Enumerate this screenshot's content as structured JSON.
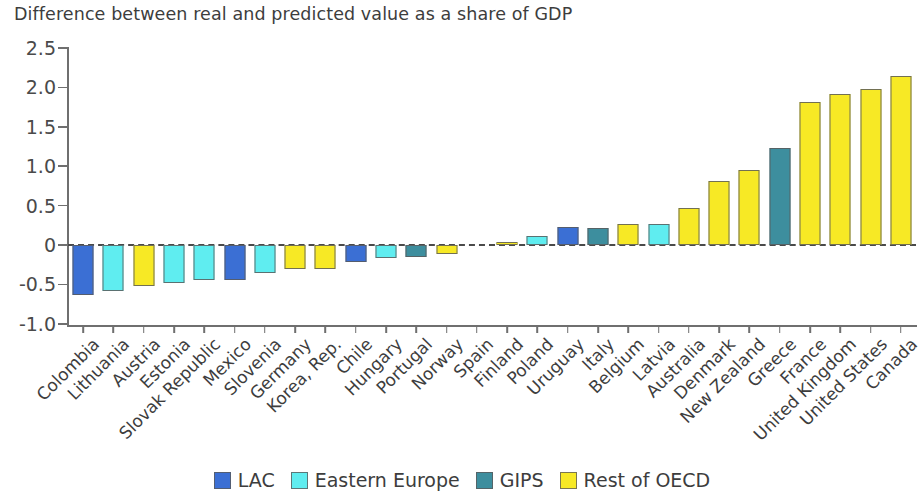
{
  "chart_data": {
    "type": "bar",
    "title": "Difference between real and predicted value as a share of GDP",
    "xlabel": "",
    "ylabel": "",
    "ylim": [
      -1.0,
      2.5
    ],
    "yticks": [
      "-1.0",
      "-0.5",
      "0",
      "0.5",
      "1.0",
      "1.5",
      "2.0",
      "2.5"
    ],
    "ytick_values": [
      -1.0,
      -0.5,
      0,
      0.5,
      1.0,
      1.5,
      2.0,
      2.5
    ],
    "grid": false,
    "zero_line": "dashed",
    "legend_position": "bottom",
    "categories": [
      "Colombia",
      "Lithuania",
      "Austria",
      "Estonia",
      "Slovak Republic",
      "Mexico",
      "Slovenia",
      "Germany",
      "Korea, Rep.",
      "Chile",
      "Hungary",
      "Portugal",
      "Norway",
      "Spain",
      "Finland",
      "Poland",
      "Uruguay",
      "Italy",
      "Belgium",
      "Latvia",
      "Australia",
      "Denmark",
      "New Zealand",
      "Greece",
      "France",
      "United Kingdom",
      "United States",
      "Canada"
    ],
    "values": [
      -0.63,
      -0.58,
      -0.52,
      -0.48,
      -0.45,
      -0.45,
      -0.35,
      -0.31,
      -0.3,
      -0.22,
      -0.17,
      -0.15,
      -0.11,
      0.0,
      0.04,
      0.11,
      0.23,
      0.22,
      0.27,
      0.27,
      0.47,
      0.81,
      0.95,
      1.23,
      1.81,
      1.91,
      1.98,
      2.14
    ],
    "groups": [
      "LAC",
      "Eastern Europe",
      "Rest of OECD",
      "Eastern Europe",
      "Eastern Europe",
      "LAC",
      "Eastern Europe",
      "Rest of OECD",
      "Rest of OECD",
      "LAC",
      "Eastern Europe",
      "GIPS",
      "Rest of OECD",
      "GIPS",
      "Rest of OECD",
      "Eastern Europe",
      "LAC",
      "GIPS",
      "Rest of OECD",
      "Eastern Europe",
      "Rest of OECD",
      "Rest of OECD",
      "Rest of OECD",
      "GIPS",
      "Rest of OECD",
      "Rest of OECD",
      "Rest of OECD",
      "Rest of OECD"
    ],
    "series": [
      {
        "name": "LAC",
        "color": "#3B6FD4"
      },
      {
        "name": "Eastern Europe",
        "color": "#5FEDF0"
      },
      {
        "name": "GIPS",
        "color": "#3D8E9E"
      },
      {
        "name": "Rest of OECD",
        "color": "#F7E925"
      }
    ]
  },
  "legend": {
    "items": [
      {
        "label": "LAC",
        "color": "#3B6FD4"
      },
      {
        "label": "Eastern Europe",
        "color": "#5FEDF0"
      },
      {
        "label": "GIPS",
        "color": "#3D8E9E"
      },
      {
        "label": "Rest of OECD",
        "color": "#F7E925"
      }
    ]
  }
}
